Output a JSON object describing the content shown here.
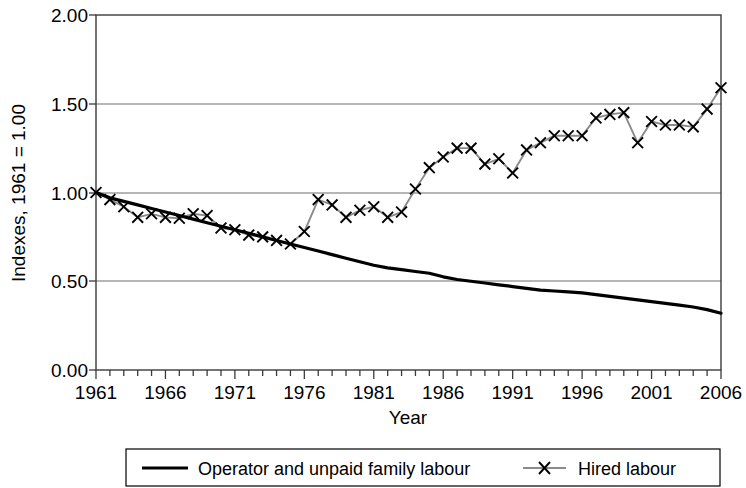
{
  "chart_data": {
    "type": "line",
    "title": "",
    "xlabel": "Year",
    "ylabel": "Indexes, 1961 = 1.00",
    "xlim": [
      1961,
      2006
    ],
    "ylim": [
      0.0,
      2.0
    ],
    "grid": true,
    "legend_position": "bottom",
    "y_ticks": [
      "0.00",
      "0.50",
      "1.00",
      "1.50",
      "2.00"
    ],
    "y_tick_values": [
      0.0,
      0.5,
      1.0,
      1.5,
      2.0
    ],
    "x_ticks": [
      "1961",
      "1966",
      "1971",
      "1976",
      "1981",
      "1986",
      "1991",
      "1996",
      "2001",
      "2006"
    ],
    "x_tick_values": [
      1961,
      1966,
      1971,
      1976,
      1981,
      1986,
      1991,
      1996,
      2001,
      2006
    ],
    "x": [
      1961,
      1962,
      1963,
      1964,
      1965,
      1966,
      1967,
      1968,
      1969,
      1970,
      1971,
      1972,
      1973,
      1974,
      1975,
      1976,
      1977,
      1978,
      1979,
      1980,
      1981,
      1982,
      1983,
      1984,
      1985,
      1986,
      1987,
      1988,
      1989,
      1990,
      1991,
      1992,
      1993,
      1994,
      1995,
      1996,
      1997,
      1998,
      1999,
      2000,
      2001,
      2002,
      2003,
      2004,
      2005,
      2006
    ],
    "series": [
      {
        "name": "Operator and unpaid family labour",
        "color": "#000000",
        "marker": "none",
        "linestyle": "solid",
        "values": [
          1.0,
          0.97,
          0.95,
          0.93,
          0.91,
          0.89,
          0.87,
          0.85,
          0.83,
          0.81,
          0.79,
          0.77,
          0.75,
          0.73,
          0.71,
          0.69,
          0.67,
          0.65,
          0.63,
          0.61,
          0.59,
          0.575,
          0.565,
          0.555,
          0.545,
          0.525,
          0.51,
          0.5,
          0.49,
          0.48,
          0.47,
          0.46,
          0.45,
          0.445,
          0.44,
          0.435,
          0.425,
          0.415,
          0.405,
          0.395,
          0.385,
          0.375,
          0.365,
          0.355,
          0.34,
          0.32
        ]
      },
      {
        "name": "Hired labour",
        "color": "#8a8a8a",
        "marker": "x",
        "marker_color": "#000000",
        "linestyle": "solid",
        "values": [
          1.0,
          0.96,
          0.92,
          0.86,
          0.88,
          0.86,
          0.855,
          0.88,
          0.87,
          0.8,
          0.79,
          0.76,
          0.75,
          0.73,
          0.71,
          0.78,
          0.96,
          0.93,
          0.86,
          0.9,
          0.92,
          0.86,
          0.89,
          1.02,
          1.14,
          1.2,
          1.25,
          1.25,
          1.16,
          1.19,
          1.11,
          1.24,
          1.28,
          1.32,
          1.32,
          1.32,
          1.42,
          1.44,
          1.45,
          1.28,
          1.4,
          1.38,
          1.38,
          1.37,
          1.47,
          1.59
        ]
      }
    ]
  },
  "legend": {
    "items": [
      {
        "label": "Operator and unpaid family labour",
        "style": "solid-black-line"
      },
      {
        "label": "Hired labour",
        "style": "gray-line-x-marker"
      }
    ]
  },
  "colors": {
    "operator_line": "#000000",
    "hired_line": "#8a8a8a",
    "hired_marker": "#000000",
    "gridline": "#6e6e6e",
    "frame": "#3b3b3b",
    "background": "#ffffff"
  }
}
